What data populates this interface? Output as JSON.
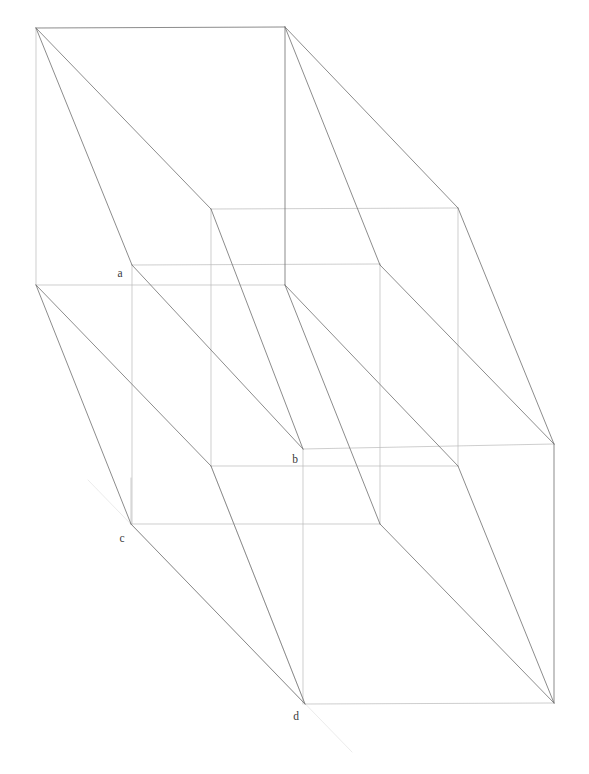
{
  "figure": {
    "background_color": "#ffffff",
    "width": 589,
    "height": 774,
    "stroke_colors": {
      "strong": "#6e6e6e",
      "medium": "#9a9a9a",
      "faint": "#c4c4c4",
      "very_faint": "#dedede",
      "ghost": "#e9e9e9"
    },
    "stroke_widths": {
      "strong": 0.85,
      "medium": 0.7,
      "faint": 0.6
    }
  },
  "labels": [
    {
      "id": "label-a",
      "text": "a",
      "x": 120,
      "y": 277
    },
    {
      "id": "label-b",
      "text": "b",
      "x": 295,
      "y": 463
    },
    {
      "id": "label-c",
      "text": "c",
      "x": 122,
      "y": 542
    },
    {
      "id": "label-d",
      "text": "d",
      "x": 296,
      "y": 720
    }
  ],
  "vertices": {
    "front_top_left": [
      36,
      28
    ],
    "front_top_right": [
      285,
      27
    ],
    "front_bottom_left": [
      36,
      285
    ],
    "front_bottom_right": [
      285,
      285
    ],
    "mid_top_left": [
      211,
      209
    ],
    "mid_top_right": [
      458,
      208
    ],
    "mid_bottom_left": [
      211,
      466
    ],
    "mid_bottom_right": [
      458,
      466
    ],
    "a": [
      132,
      265
    ],
    "b": [
      303,
      449
    ],
    "c": [
      131,
      524
    ],
    "d": [
      305,
      704
    ],
    "back_right_top": [
      554,
      444
    ],
    "back_right_bottom": [
      554,
      703
    ],
    "inner_lower_left": [
      131,
      478
    ],
    "inner_lower_right": [
      380,
      524
    ],
    "a_col_bottom": [
      132,
      524
    ],
    "b_col_bottom": [
      303,
      704
    ]
  },
  "edges": {
    "strong": [
      {
        "name": "front-top-edge",
        "from": [
          36,
          28
        ],
        "to": [
          285,
          27
        ]
      },
      {
        "name": "front-right-vertical-upper",
        "from": [
          285,
          27
        ],
        "to": [
          285,
          285
        ]
      },
      {
        "name": "diagonal-tl-to-mid-top-left",
        "from": [
          36,
          28
        ],
        "to": [
          211,
          209
        ]
      },
      {
        "name": "diagonal-mid-top-left-to-b",
        "from": [
          211,
          209
        ],
        "to": [
          303,
          449
        ]
      },
      {
        "name": "diagonal-tl-to-a",
        "from": [
          36,
          28
        ],
        "to": [
          132,
          265
        ]
      },
      {
        "name": "diagonal-a-to-b",
        "from": [
          132,
          265
        ],
        "to": [
          303,
          449
        ]
      },
      {
        "name": "diagonal-tr-to-mid-top-right",
        "from": [
          285,
          27
        ],
        "to": [
          458,
          208
        ]
      },
      {
        "name": "diagonal-mid-top-right-to-backright",
        "from": [
          458,
          208
        ],
        "to": [
          554,
          444
        ]
      },
      {
        "name": "diagonal-tr-to-midright",
        "from": [
          285,
          27
        ],
        "to": [
          380,
          265
        ]
      },
      {
        "name": "diagonal-midright-to-backright",
        "from": [
          380,
          265
        ],
        "to": [
          554,
          444
        ]
      },
      {
        "name": "right-vertical-back",
        "from": [
          554,
          444
        ],
        "to": [
          554,
          703
        ]
      },
      {
        "name": "diagonal-fbr-to-inner",
        "from": [
          285,
          285
        ],
        "to": [
          380,
          524
        ]
      },
      {
        "name": "diagonal-inner-to-backbottom",
        "from": [
          380,
          524
        ],
        "to": [
          554,
          703
        ]
      },
      {
        "name": "diagonal-fbr-to-midbl",
        "from": [
          285,
          285
        ],
        "to": [
          458,
          466
        ]
      },
      {
        "name": "diagonal-midbl-to-backbottom",
        "from": [
          458,
          466
        ],
        "to": [
          554,
          703
        ]
      },
      {
        "name": "diagonal-fbl-to-c",
        "from": [
          36,
          285
        ],
        "to": [
          131,
          524
        ]
      },
      {
        "name": "diagonal-c-to-d",
        "from": [
          131,
          524
        ],
        "to": [
          305,
          704
        ]
      },
      {
        "name": "diagonal-fbl-to-midbottomleft",
        "from": [
          36,
          285
        ],
        "to": [
          211,
          466
        ]
      },
      {
        "name": "diagonal-midbottomleft-to-d",
        "from": [
          211,
          466
        ],
        "to": [
          305,
          704
        ]
      }
    ],
    "medium": [
      {
        "name": "front-left-vertical",
        "from": [
          36,
          28
        ],
        "to": [
          36,
          285
        ]
      },
      {
        "name": "front-bottom-edge",
        "from": [
          36,
          285
        ],
        "to": [
          285,
          285
        ]
      },
      {
        "name": "mid-top-edge",
        "from": [
          211,
          209
        ],
        "to": [
          458,
          208
        ]
      },
      {
        "name": "mid-right-vertical",
        "from": [
          458,
          208
        ],
        "to": [
          458,
          466
        ]
      },
      {
        "name": "mid-left-vertical",
        "from": [
          211,
          209
        ],
        "to": [
          211,
          466
        ]
      },
      {
        "name": "mid-bottom-edge",
        "from": [
          211,
          466
        ],
        "to": [
          458,
          466
        ]
      },
      {
        "name": "back-bottom-edge",
        "from": [
          305,
          704
        ],
        "to": [
          554,
          703
        ]
      },
      {
        "name": "back-top-edge",
        "from": [
          303,
          449
        ],
        "to": [
          554,
          444
        ]
      },
      {
        "name": "b-vertical",
        "from": [
          303,
          449
        ],
        "to": [
          303,
          704
        ]
      },
      {
        "name": "a-vertical",
        "from": [
          132,
          265
        ],
        "to": [
          132,
          524
        ]
      },
      {
        "name": "a-to-mid-top-horizontal",
        "from": [
          132,
          265
        ],
        "to": [
          380,
          264
        ]
      },
      {
        "name": "c-to-inner-horizontal",
        "from": [
          131,
          524
        ],
        "to": [
          380,
          524
        ]
      },
      {
        "name": "a-col-to-c-left-vertical",
        "from": [
          131,
          478
        ],
        "to": [
          131,
          524
        ]
      },
      {
        "name": "inner-right-vertical",
        "from": [
          380,
          264
        ],
        "to": [
          380,
          524
        ]
      }
    ],
    "faint": [
      {
        "name": "ghost-diagonal-through-d",
        "from": [
          88,
          480
        ],
        "to": [
          352,
          752
        ]
      },
      {
        "name": "ghost-diagonal-upper",
        "from": [
          211,
          466
        ],
        "to": [
          305,
          704
        ]
      }
    ]
  },
  "geometry_notes": {
    "description": "Axonometric wireframe of two overlapping rectangular prisms sharing projection rays; labelled intersection points a, b, c, d",
    "label_count": 4
  }
}
